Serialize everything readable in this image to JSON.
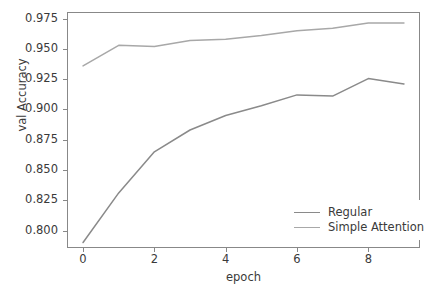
{
  "chart_data": {
    "type": "line",
    "title": "",
    "xlabel": "epoch",
    "ylabel": "val Accuracy",
    "x": [
      0,
      1,
      2,
      3,
      4,
      5,
      6,
      7,
      8,
      9
    ],
    "xlim": [
      -0.45,
      9.45
    ],
    "ylim": [
      0.7855,
      0.9805
    ],
    "xticks": [
      "0",
      "2",
      "4",
      "6",
      "8"
    ],
    "xtick_values": [
      0,
      2,
      4,
      6,
      8
    ],
    "yticks": [
      "0.800",
      "0.825",
      "0.850",
      "0.875",
      "0.900",
      "0.925",
      "0.950",
      "0.975"
    ],
    "ytick_values": [
      0.8,
      0.825,
      0.85,
      0.875,
      0.9,
      0.925,
      0.95,
      0.975
    ],
    "grid": false,
    "legend_position": "lower right",
    "series": [
      {
        "name": "Regular",
        "color": "#8a8a8a",
        "values": [
          0.79,
          0.831,
          0.865,
          0.883,
          0.895,
          0.903,
          0.912,
          0.911,
          0.9255,
          0.921
        ]
      },
      {
        "name": "Simple Attention",
        "color": "#a8a8a8",
        "values": [
          0.936,
          0.953,
          0.952,
          0.957,
          0.958,
          0.961,
          0.965,
          0.967,
          0.9715,
          0.9715
        ]
      }
    ]
  },
  "axis_color": "#888888",
  "text_color": "#3a3a3a",
  "background": "#ffffff"
}
